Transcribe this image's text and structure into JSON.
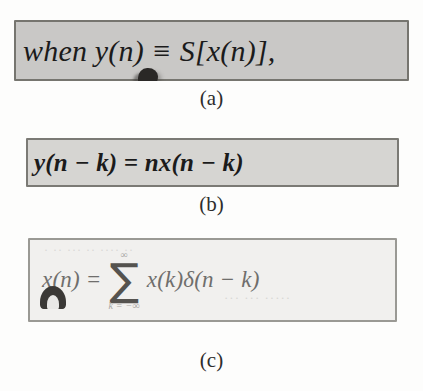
{
  "figure": {
    "kind": "scanned-textbook-equation-figure",
    "background_color": "#fdfdfc"
  },
  "panels": [
    {
      "id": "a",
      "caption": "(a)",
      "equation_text": "when y(n) ≡ S[x(n)],",
      "background_color": "#c9c8c6",
      "border_color": "#76756f",
      "smudge": "ink-blob-under-y"
    },
    {
      "id": "b",
      "caption": "(b)",
      "equation_text": "y(n − k) = nx(n − k)",
      "background_color": "#d6d5d2",
      "border_color": "#7b7a75",
      "smudge": "ink-blob-over-k"
    },
    {
      "id": "c",
      "caption": "(c)",
      "equation": {
        "lhs": "x(n) =",
        "summation": {
          "upper_limit": "∞",
          "symbol": "∑",
          "lower_limit": "k = −∞"
        },
        "rhs": "x(k)δ(n − k)"
      },
      "background_color": "#f1f0ee",
      "border_color": "#9a9994",
      "smudge": "ink-blob-bottom-left",
      "ghost_text": {
        "top": "·  ··  ···   ··  ····  ··",
        "middle": "···  ··· ·····"
      }
    }
  ]
}
